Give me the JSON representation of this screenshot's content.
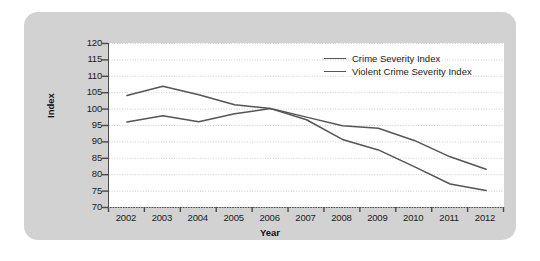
{
  "chart_data": {
    "type": "line",
    "title": "",
    "xlabel": "Year",
    "ylabel": "Index",
    "x": [
      2002,
      2003,
      2004,
      2005,
      2006,
      2007,
      2008,
      2009,
      2010,
      2011,
      2012
    ],
    "xtick_labels": [
      "2002",
      "2003",
      "2004",
      "2005",
      "2006",
      "2007",
      "2008",
      "2009",
      "2010",
      "2011",
      "2012"
    ],
    "ytick_labels": [
      "120",
      "115",
      "110",
      "105",
      "100",
      "95",
      "90",
      "85",
      "80",
      "75",
      "70"
    ],
    "ylim": [
      70,
      120
    ],
    "ytick_step": 5,
    "grid": true,
    "legend_position": "upper-right",
    "series": [
      {
        "name": "Crime Severity Index",
        "color": "#555555",
        "values": [
          104.0,
          106.8,
          104.2,
          101.2,
          100.0,
          97.4,
          94.8,
          94.0,
          90.3,
          85.3,
          81.5
        ]
      },
      {
        "name": "Violent Crime Severity Index",
        "color": "#555555",
        "values": [
          95.9,
          97.8,
          96.0,
          98.4,
          100.0,
          96.6,
          90.6,
          87.4,
          82.3,
          77.0,
          75.0
        ]
      }
    ]
  },
  "axis": {
    "y_title": "Index",
    "x_title": "Year"
  },
  "legend": {
    "items": [
      {
        "label": "Crime Severity Index"
      },
      {
        "label": "Violent Crime Severity Index"
      }
    ]
  }
}
